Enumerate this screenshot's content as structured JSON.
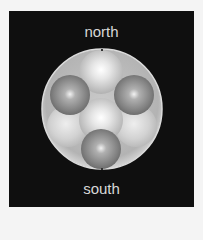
{
  "diagram": {
    "labels": {
      "top": "north",
      "bottom": "south"
    },
    "colors": {
      "background": "#0f0f0f",
      "frame": "#f4f4f4",
      "label_text": "#d8d8d8",
      "outer_sphere": "#bdbdbd",
      "light_sphere": "#e0e0e0",
      "dark_sphere": "#8a8a8a"
    },
    "outer_sphere": {
      "cx": 102,
      "cy": 109,
      "r": 60
    },
    "inner_spheres": [
      {
        "name": "left-lower",
        "tone": "faint",
        "cx": 68,
        "cy": 126,
        "r": 21
      },
      {
        "name": "right-lower",
        "tone": "faint",
        "cx": 136,
        "cy": 126,
        "r": 21
      },
      {
        "name": "top-center",
        "tone": "light",
        "cx": 101,
        "cy": 72,
        "r": 22
      },
      {
        "name": "middle",
        "tone": "light",
        "cx": 101,
        "cy": 120,
        "r": 22
      },
      {
        "name": "left",
        "tone": "dark",
        "cx": 70,
        "cy": 95,
        "r": 20
      },
      {
        "name": "right",
        "tone": "dark",
        "cx": 134,
        "cy": 95,
        "r": 20
      },
      {
        "name": "bottom",
        "tone": "dark",
        "cx": 101,
        "cy": 149,
        "r": 20
      }
    ],
    "pole_markers": [
      {
        "name": "north-pole-marker",
        "cx": 102,
        "cy": 50
      },
      {
        "name": "south-pole-marker",
        "cx": 102,
        "cy": 169
      }
    ]
  }
}
